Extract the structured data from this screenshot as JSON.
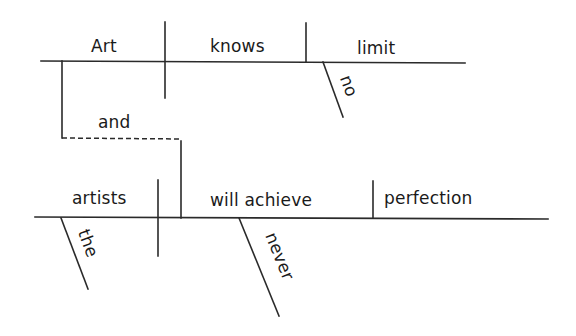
{
  "diagram": {
    "type": "sentence-diagram",
    "sentence": "Art knows no limit and artists will never achieve perfection",
    "clause1": {
      "subject": "Art",
      "verb": "knows",
      "object": "limit",
      "modifiers": [
        {
          "word": "no",
          "modifies": "limit"
        }
      ]
    },
    "conjunction": "and",
    "clause2": {
      "subject": "artists",
      "verb": "will achieve",
      "object": "perfection",
      "modifiers": [
        {
          "word": "the",
          "modifies": "artists"
        },
        {
          "word": "never",
          "modifies": "will achieve"
        }
      ]
    },
    "colors": {
      "line": "#2a2a2a",
      "text": "#1a1a1a",
      "background": "#ffffff"
    }
  }
}
